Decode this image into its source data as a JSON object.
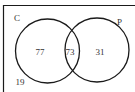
{
  "diagram": {
    "type": "venn",
    "universe_count": "19",
    "sets": [
      {
        "label": "C",
        "only_count": "77"
      },
      {
        "label": "P",
        "only_count": "31"
      }
    ],
    "intersection_count": "73",
    "colors": {
      "stroke": "#1a1a1a",
      "text": "#333333",
      "background": "#ffffff"
    }
  }
}
